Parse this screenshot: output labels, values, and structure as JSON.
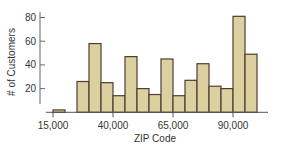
{
  "chart_data": {
    "type": "bar",
    "subtype": "histogram",
    "title": "",
    "xlabel": "ZIP Code",
    "ylabel": "# of Customers",
    "bin_width": 5000,
    "bins": [
      {
        "start": 15000,
        "end": 20000,
        "value": 2
      },
      {
        "start": 20000,
        "end": 25000,
        "value": 0
      },
      {
        "start": 25000,
        "end": 30000,
        "value": 26
      },
      {
        "start": 30000,
        "end": 35000,
        "value": 58
      },
      {
        "start": 35000,
        "end": 40000,
        "value": 25
      },
      {
        "start": 40000,
        "end": 45000,
        "value": 14
      },
      {
        "start": 45000,
        "end": 50000,
        "value": 47
      },
      {
        "start": 50000,
        "end": 55000,
        "value": 20
      },
      {
        "start": 55000,
        "end": 60000,
        "value": 15
      },
      {
        "start": 60000,
        "end": 65000,
        "value": 45
      },
      {
        "start": 65000,
        "end": 70000,
        "value": 14
      },
      {
        "start": 70000,
        "end": 75000,
        "value": 27
      },
      {
        "start": 75000,
        "end": 80000,
        "value": 41
      },
      {
        "start": 80000,
        "end": 85000,
        "value": 22
      },
      {
        "start": 85000,
        "end": 90000,
        "value": 20
      },
      {
        "start": 90000,
        "end": 95000,
        "value": 81
      },
      {
        "start": 95000,
        "end": 100000,
        "value": 49
      }
    ],
    "x_ticks": [
      {
        "value": 15000,
        "label": "15,000"
      },
      {
        "value": 40000,
        "label": "40,000"
      },
      {
        "value": 65000,
        "label": "65,000"
      },
      {
        "value": 90000,
        "label": "90,000"
      }
    ],
    "y_ticks": [
      {
        "value": 20,
        "label": "20"
      },
      {
        "value": 40,
        "label": "40"
      },
      {
        "value": 60,
        "label": "60"
      },
      {
        "value": 80,
        "label": "80"
      }
    ],
    "ylim": [
      0,
      85
    ],
    "xlim": [
      10000,
      105000
    ],
    "grid": false,
    "legend": null,
    "colors": {
      "bar_fill": "#ddd0a0",
      "bar_stroke": "#4a4030",
      "axis": "#555555"
    }
  }
}
